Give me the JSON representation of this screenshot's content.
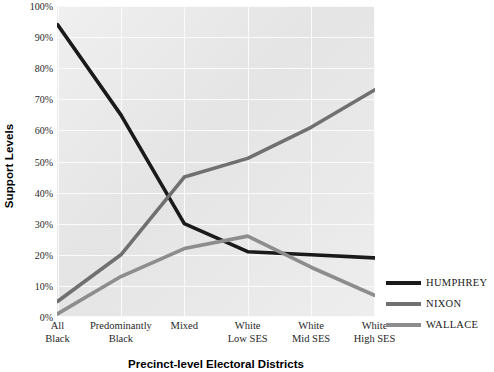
{
  "chart_data": {
    "type": "line",
    "title": "",
    "xlabel": "Precinct-level Electoral Districts",
    "ylabel": "Support Levels",
    "categories": [
      "All\nBlack",
      "Predominantly\nBlack",
      "Mixed",
      "White\nLow SES",
      "White\nMid SES",
      "White\nHigh SES"
    ],
    "ylim": [
      0,
      100
    ],
    "ytick_labels": [
      "0%",
      "10%",
      "20%",
      "30%",
      "40%",
      "50%",
      "60%",
      "70%",
      "80%",
      "90%",
      "100%"
    ],
    "ytick_values": [
      0,
      10,
      20,
      30,
      40,
      50,
      60,
      70,
      80,
      90,
      100
    ],
    "grid": true,
    "legend_position": "right",
    "series": [
      {
        "name": "HUMPHREY",
        "color": "#1a1a1a",
        "values": [
          94,
          65,
          30,
          21,
          20,
          19
        ]
      },
      {
        "name": "NIXON",
        "color": "#707070",
        "values": [
          5,
          20,
          45,
          51,
          61,
          73
        ]
      },
      {
        "name": "WALLACE",
        "color": "#8d8d8d",
        "values": [
          1,
          13,
          22,
          26,
          16,
          7
        ]
      }
    ]
  },
  "style": {
    "plot_background": "#e9e9e9",
    "gridline_color": "#fbfbfb",
    "text_color": "#1a1a1a"
  }
}
